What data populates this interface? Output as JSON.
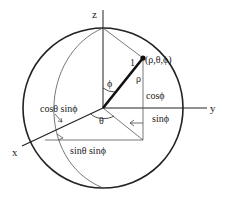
{
  "diagram": {
    "type": "spherical-coordinates",
    "axes": {
      "x_label": "x",
      "y_label": "y",
      "z_label": "z"
    },
    "point_label": "(ρ,θ,ϕ)",
    "unit_radius_label": "1",
    "rho_label": "ρ",
    "phi_label": "ϕ",
    "theta_label": "θ",
    "projections": {
      "cos_phi": "cosϕ",
      "sin_phi": "sinϕ",
      "cos_theta_sin_phi": "cosθ sinϕ",
      "sin_theta_sin_phi": "sinθ sinϕ"
    },
    "colors": {
      "stroke": "#222222",
      "thin_stroke": "#555555",
      "background": "#ffffff"
    }
  }
}
